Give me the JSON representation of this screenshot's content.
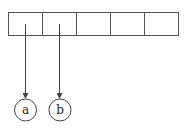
{
  "diagram": {
    "type": "array-pointer",
    "array": {
      "cell_count": 5,
      "cells": [
        {
          "index": 0,
          "value": ""
        },
        {
          "index": 1,
          "value": ""
        },
        {
          "index": 2,
          "value": ""
        },
        {
          "index": 3,
          "value": ""
        },
        {
          "index": 4,
          "value": ""
        }
      ]
    },
    "nodes": [
      {
        "id": "a",
        "label": "a",
        "pointed_from_cell": 0
      },
      {
        "id": "b",
        "label": "b",
        "pointed_from_cell": 1
      }
    ],
    "colors": {
      "stroke": "#444444",
      "background": "#ffffff"
    }
  }
}
